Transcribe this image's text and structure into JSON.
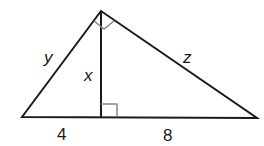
{
  "diagram": {
    "type": "right-triangle-with-altitude",
    "vertices": {
      "left": [
        22,
        117
      ],
      "top": [
        101,
        11
      ],
      "right": [
        257,
        118
      ],
      "altitude_foot": [
        101,
        117
      ]
    },
    "labels": {
      "y": "y",
      "x": "x",
      "z": "z",
      "left_segment": "4",
      "right_segment": "8"
    },
    "stroke_color": "#1a1a1a",
    "marker_color": "#888888"
  }
}
